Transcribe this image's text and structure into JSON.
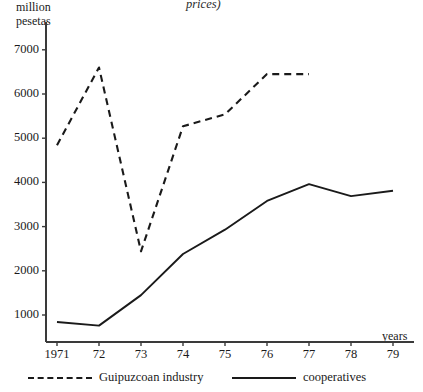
{
  "title_fragment": "prices)",
  "axis_titles": {
    "y_line1": "million",
    "y_line2": "pesetas",
    "x": "years"
  },
  "chart_data": {
    "type": "line",
    "title": "prices)",
    "xlabel": "years",
    "ylabel": "million pesetas",
    "grid": false,
    "legend_position": "bottom",
    "x": [
      "1971",
      "72",
      "73",
      "74",
      "75",
      "76",
      "77",
      "78",
      "79"
    ],
    "xlim": [
      1971,
      1979
    ],
    "ylim": [
      0,
      7400
    ],
    "yticks": [
      1000,
      2000,
      3000,
      4000,
      5000,
      6000,
      7000
    ],
    "ytick_labels": [
      "1000",
      "2000",
      "3000",
      "4000",
      "5000",
      "6000",
      "7000"
    ],
    "xtick_labels": [
      "1971",
      "72",
      "73",
      "74",
      "75",
      "76",
      "77",
      "78",
      "79"
    ],
    "series": [
      {
        "name": "Guipuzcoan industry",
        "style": "dashed",
        "color": "#1a1a1a",
        "x": [
          "1971",
          "72",
          "73",
          "74",
          "75",
          "76",
          "77"
        ],
        "values": [
          4840,
          6600,
          2440,
          5270,
          5540,
          6450,
          6450
        ]
      },
      {
        "name": "cooperatives",
        "style": "solid",
        "color": "#1a1a1a",
        "x": [
          "1971",
          "72",
          "73",
          "74",
          "75",
          "76",
          "77",
          "78",
          "79"
        ],
        "values": [
          840,
          760,
          1450,
          2380,
          2930,
          3580,
          3960,
          3690,
          3810
        ]
      }
    ]
  },
  "legend": [
    {
      "label": "Guipuzcoan industry",
      "style": "dashed"
    },
    {
      "label": "cooperatives",
      "style": "solid"
    }
  ]
}
